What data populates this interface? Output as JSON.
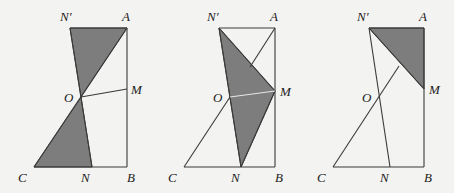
{
  "diagram": {
    "type": "geometry-figure",
    "panels": [
      {
        "id": "panel-1",
        "labels": {
          "N_prime": "N′",
          "A": "A",
          "M": "M",
          "O": "O",
          "C": "C",
          "N": "N",
          "B": "B"
        },
        "points": {
          "N_prime": [
            70,
            28
          ],
          "A": [
            127,
            28
          ],
          "M": [
            127,
            89
          ],
          "O": [
            81,
            97
          ],
          "C": [
            34,
            167
          ],
          "N": [
            92,
            167
          ],
          "B": [
            127,
            167
          ]
        },
        "shaded": [
          [
            "N_prime",
            "A",
            "O"
          ],
          [
            "O",
            "C",
            "N"
          ]
        ],
        "segments": [
          [
            "N_prime",
            "A"
          ],
          [
            "A",
            "B"
          ],
          [
            "C",
            "B"
          ],
          [
            "C",
            "A"
          ],
          [
            "N_prime",
            "N"
          ],
          [
            "O",
            "M"
          ]
        ]
      },
      {
        "id": "panel-2",
        "labels": {
          "N_prime": "N′",
          "A": "A",
          "M": "M",
          "O": "O",
          "C": "C",
          "N": "N",
          "B": "B"
        },
        "points": {
          "N_prime": [
            219,
            28
          ],
          "A": [
            275,
            28
          ],
          "M": [
            275,
            91
          ],
          "O": [
            230,
            97
          ],
          "C": [
            184,
            167
          ],
          "N": [
            241,
            167
          ],
          "B": [
            275,
            167
          ]
        },
        "shaded": [
          [
            "N_prime",
            "M",
            "N"
          ]
        ],
        "segments": [
          [
            "N_prime",
            "A"
          ],
          [
            "A",
            "B"
          ],
          [
            "C",
            "B"
          ],
          [
            "C",
            "A"
          ],
          [
            "N_prime",
            "N"
          ],
          [
            "O",
            "M"
          ],
          [
            "N_prime",
            "M"
          ],
          [
            "M",
            "N"
          ]
        ]
      },
      {
        "id": "panel-3",
        "labels": {
          "N_prime": "N′",
          "A": "A",
          "M": "M",
          "O": "O",
          "C": "C",
          "N": "N",
          "B": "B"
        },
        "points": {
          "N_prime": [
            369,
            28
          ],
          "A": [
            424,
            28
          ],
          "M": [
            424,
            89
          ],
          "O": [
            379,
            97
          ],
          "C": [
            333,
            167
          ],
          "N": [
            390,
            167
          ],
          "B": [
            424,
            167
          ],
          "P": [
            399,
            66
          ]
        },
        "shaded": [
          [
            "N_prime",
            "A",
            "M"
          ]
        ],
        "segments": [
          [
            "N_prime",
            "A"
          ],
          [
            "A",
            "B"
          ],
          [
            "C",
            "B"
          ],
          [
            "C",
            "P"
          ],
          [
            "N_prime",
            "N"
          ],
          [
            "N_prime",
            "M"
          ]
        ]
      }
    ],
    "colors": {
      "shade": "#7d7d7d",
      "line": "#3a3a3a",
      "background": "#f3f3f1"
    }
  }
}
